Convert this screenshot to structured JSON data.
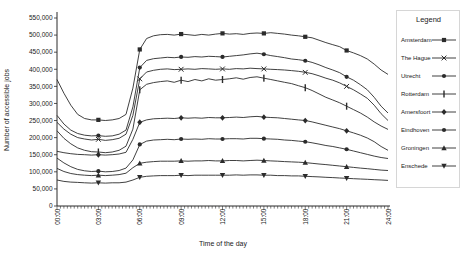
{
  "figure": {
    "background": "#ffffff"
  },
  "colors": {
    "line": "#2b2b2b",
    "text": "#1a1a1a",
    "legend_border": "#d6d6d6"
  },
  "chart_data": {
    "type": "line",
    "title": "",
    "legend_title": "Legend",
    "legend_position": "right",
    "grid": false,
    "xlabel": "Time of the day",
    "ylabel": "Number of accessible jobs",
    "xlim_hours": [
      0,
      24
    ],
    "x_step_hours": 0.5,
    "marker_every_hours": 3,
    "x_tick_labels": [
      "00:00",
      "03:00",
      "06:00",
      "09:00",
      "12:00",
      "15:00",
      "18:00",
      "21:00",
      "24:00"
    ],
    "ylim": [
      0,
      550000
    ],
    "y_ticks": [
      0,
      50000,
      100000,
      150000,
      200000,
      250000,
      300000,
      350000,
      400000,
      450000,
      500000,
      550000
    ],
    "y_tick_labels": [
      "0",
      "50,000",
      "100,000",
      "150,000",
      "200,000",
      "250,000",
      "300,000",
      "350,000",
      "400,000",
      "450,000",
      "500,000",
      "550,000"
    ],
    "series": [
      {
        "name": "Amsterdam",
        "marker": "square",
        "values": [
          370000,
          330000,
          295000,
          268000,
          256000,
          252000,
          252000,
          250000,
          252000,
          256000,
          268000,
          345000,
          458000,
          490000,
          498000,
          501000,
          502000,
          500000,
          503000,
          501000,
          499000,
          502000,
          500000,
          503000,
          505000,
          503000,
          504000,
          502000,
          505000,
          506000,
          505000,
          507000,
          505000,
          503000,
          500000,
          498000,
          495000,
          492000,
          485000,
          478000,
          472000,
          466000,
          455000,
          448000,
          440000,
          430000,
          415000,
          398000,
          385000
        ]
      },
      {
        "name": "The Hague",
        "marker": "x",
        "values": [
          245000,
          225000,
          210000,
          200000,
          196000,
          193000,
          195000,
          192000,
          194000,
          198000,
          210000,
          265000,
          372000,
          392000,
          397000,
          400000,
          401000,
          399000,
          400000,
          401000,
          400000,
          402000,
          401000,
          400000,
          401000,
          400000,
          402000,
          401000,
          403000,
          402000,
          401000,
          400000,
          399000,
          398000,
          396000,
          394000,
          391000,
          387000,
          381000,
          374000,
          368000,
          360000,
          350000,
          340000,
          328000,
          315000,
          295000,
          270000,
          250000
        ]
      },
      {
        "name": "Utrecht",
        "marker": "circle",
        "values": [
          265000,
          240000,
          222000,
          212000,
          207000,
          205000,
          206000,
          204000,
          205000,
          210000,
          222000,
          290000,
          405000,
          426000,
          431000,
          433000,
          435000,
          434000,
          436000,
          435000,
          437000,
          436000,
          438000,
          437000,
          436000,
          438000,
          440000,
          442000,
          445000,
          447000,
          444000,
          440000,
          437000,
          434000,
          430000,
          428000,
          425000,
          420000,
          413000,
          405000,
          398000,
          390000,
          378000,
          368000,
          355000,
          340000,
          318000,
          292000,
          272000
        ]
      },
      {
        "name": "Rotterdam",
        "marker": "vbar",
        "values": [
          220000,
          198000,
          182000,
          170000,
          163000,
          159000,
          158000,
          156000,
          158000,
          163000,
          175000,
          225000,
          340000,
          356000,
          361000,
          364000,
          366000,
          362000,
          368000,
          364000,
          370000,
          366000,
          372000,
          368000,
          370000,
          372000,
          375000,
          371000,
          376000,
          378000,
          374000,
          370000,
          366000,
          362000,
          358000,
          352000,
          346000,
          338000,
          328000,
          318000,
          310000,
          302000,
          292000,
          282000,
          272000,
          260000,
          246000,
          234000,
          224000
        ]
      },
      {
        "name": "Amersfoort",
        "marker": "diamond",
        "values": [
          160000,
          156000,
          153000,
          151000,
          150000,
          149000,
          150000,
          149000,
          150000,
          152000,
          157000,
          195000,
          245000,
          252000,
          255000,
          256000,
          257000,
          256000,
          258000,
          257000,
          258000,
          257000,
          259000,
          258000,
          258000,
          259000,
          260000,
          259000,
          261000,
          262000,
          260000,
          259000,
          258000,
          256000,
          254000,
          252000,
          250000,
          246000,
          241000,
          236000,
          231000,
          226000,
          220000,
          214000,
          207000,
          199000,
          188000,
          174000,
          163000
        ]
      },
      {
        "name": "Eindhoven",
        "marker": "circle",
        "values": [
          140000,
          126000,
          115000,
          107000,
          103000,
          101000,
          102000,
          100000,
          101000,
          104000,
          111000,
          135000,
          180000,
          190000,
          193000,
          194000,
          195000,
          194000,
          196000,
          195000,
          196000,
          195000,
          197000,
          196000,
          196000,
          197000,
          197000,
          196000,
          198000,
          198000,
          197000,
          196000,
          195000,
          193000,
          192000,
          190000,
          188000,
          185000,
          181000,
          177000,
          174000,
          170000,
          166000,
          161000,
          156000,
          151000,
          146000,
          142000,
          139000
        ]
      },
      {
        "name": "Groningen",
        "marker": "triangle-up",
        "values": [
          110000,
          101000,
          95000,
          92000,
          90000,
          89000,
          90000,
          89000,
          90000,
          92000,
          96000,
          112000,
          125000,
          128000,
          130000,
          131000,
          131000,
          131000,
          132000,
          131000,
          132000,
          132000,
          133000,
          132000,
          132000,
          133000,
          133000,
          132000,
          133000,
          134000,
          133000,
          132000,
          131000,
          130000,
          129000,
          128000,
          127000,
          125000,
          123000,
          121000,
          119000,
          117000,
          115000,
          113000,
          111000,
          109000,
          107000,
          105000,
          104000
        ]
      },
      {
        "name": "Enschede",
        "marker": "triangle-down",
        "values": [
          76000,
          72000,
          70000,
          69000,
          68000,
          67000,
          68000,
          67000,
          68000,
          68000,
          70000,
          76000,
          84000,
          87000,
          88000,
          89000,
          89000,
          89000,
          90000,
          89000,
          90000,
          90000,
          90000,
          90000,
          90000,
          90000,
          91000,
          90000,
          91000,
          91000,
          90000,
          90000,
          89000,
          89000,
          88000,
          88000,
          87000,
          86000,
          85000,
          84000,
          83000,
          82000,
          81000,
          80000,
          79000,
          78000,
          77000,
          76000,
          75000
        ]
      }
    ]
  }
}
